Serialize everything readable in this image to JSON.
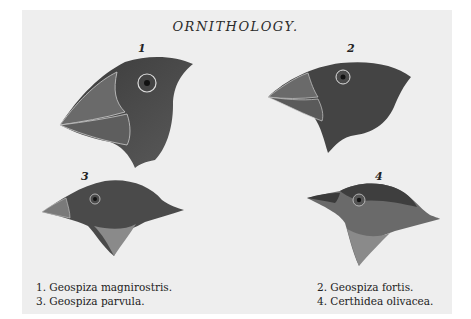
{
  "title": "ORNITHOLOGY.",
  "figures": [
    {
      "number": "1",
      "species": "Geospiza magnirostris."
    },
    {
      "number": "2",
      "species": "Geospiza fortis."
    },
    {
      "number": "3",
      "species": "Geospiza parvula."
    },
    {
      "number": "4",
      "species": "Certhidea olivacea."
    }
  ],
  "captions": {
    "left": [
      "1. Geospiza magnirostris.",
      "3. Geospiza parvula."
    ],
    "right": [
      "2. Geospiza fortis.",
      "4. Certhidea olivacea."
    ]
  }
}
